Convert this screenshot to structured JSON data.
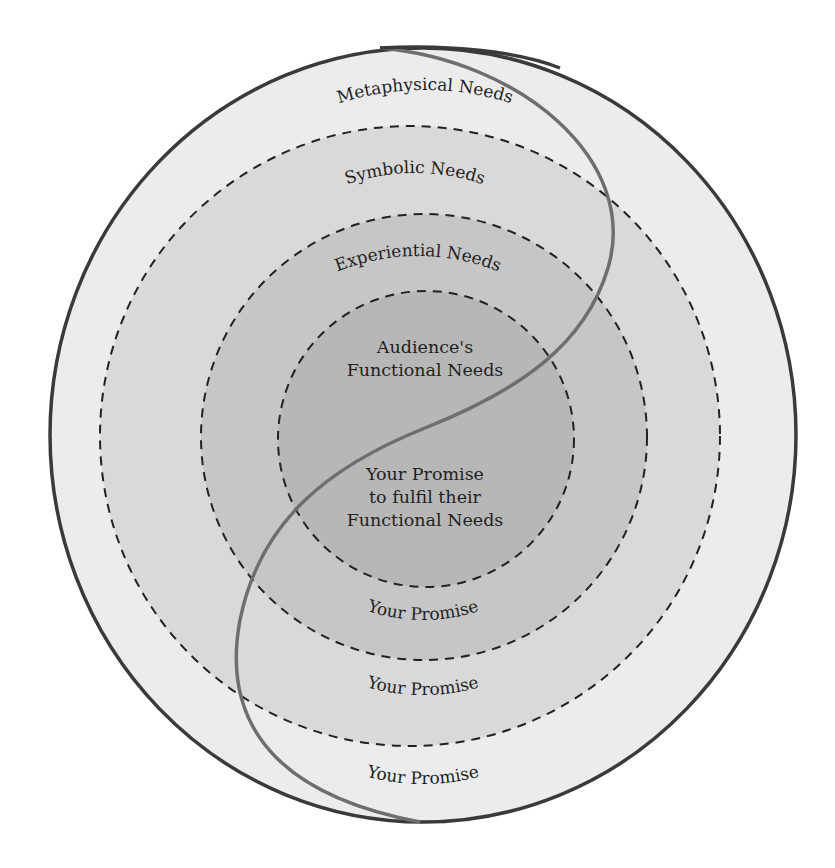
{
  "diagram": {
    "colors": {
      "background": "#ffffff",
      "outer_ring": "#ececec",
      "symbolic_ring": "#d9d9d9",
      "experiential_ring": "#c6c6c6",
      "functional_core": "#b7b7b7",
      "outline": "#3a3a3a",
      "dash": "#222222",
      "s_curve": "#6e6e6e",
      "text": "#1f1f1f"
    },
    "needs_labels": {
      "metaphysical": "Metaphysical Needs",
      "symbolic": "Symbolic Needs",
      "experiential": "Experiential Needs",
      "functional_line1": "Audience's",
      "functional_line2": "Functional Needs"
    },
    "promise_labels": {
      "core_line1": "Your Promise",
      "core_line2": "to fulfil their",
      "core_line3": "Functional Needs",
      "experiential": "Your Promise",
      "symbolic": "Your Promise",
      "metaphysical": "Your Promise"
    },
    "layers": [
      {
        "name": "Metaphysical",
        "need": "Metaphysical Needs",
        "promise": "Your Promise"
      },
      {
        "name": "Symbolic",
        "need": "Symbolic Needs",
        "promise": "Your Promise"
      },
      {
        "name": "Experiential",
        "need": "Experiential Needs",
        "promise": "Your Promise"
      },
      {
        "name": "Functional",
        "need": "Audience's Functional Needs",
        "promise": "Your Promise to fulfil their Functional Needs"
      }
    ]
  }
}
